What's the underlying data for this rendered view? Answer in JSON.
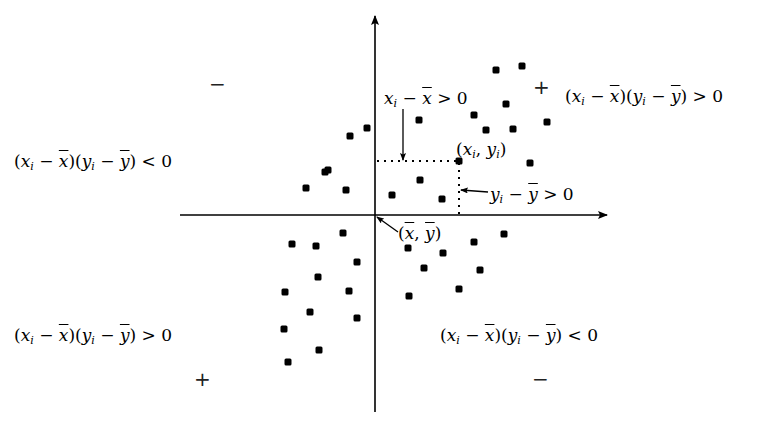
{
  "diagram": {
    "colors": {
      "background": "#ffffff",
      "ink": "#000000"
    },
    "axes": {
      "origin_label": "(x̄, ȳ)",
      "origin_px": [
        375,
        215
      ],
      "x_axis_px": {
        "from": 180,
        "to": 608,
        "y": 215
      },
      "y_axis_px": {
        "from": 412,
        "to": 15,
        "x": 375
      }
    },
    "highlighted_point": {
      "label": "(x_i, y_i)",
      "px": [
        459,
        161
      ],
      "annotations": {
        "dx": "x_i − x̄ > 0",
        "dy": "y_i − ȳ > 0"
      }
    },
    "quadrants": {
      "top_right": {
        "sign": "+",
        "condition": "(x_i − x̄)(y_i − ȳ) > 0"
      },
      "top_left": {
        "sign": "−",
        "condition": "(x_i − x̄)(y_i − ȳ) < 0"
      },
      "bottom_left": {
        "sign": "+",
        "condition": "(x_i − x̄)(y_i − ȳ) > 0"
      },
      "bottom_right": {
        "sign": "−",
        "condition": "(x_i − x̄)(y_i − ȳ) < 0"
      }
    },
    "points_px": [
      [
        367,
        128
      ],
      [
        350,
        136
      ],
      [
        328,
        170
      ],
      [
        325,
        172
      ],
      [
        306,
        188
      ],
      [
        346,
        190
      ],
      [
        419,
        120
      ],
      [
        392,
        195
      ],
      [
        420,
        180
      ],
      [
        442,
        199
      ],
      [
        474,
        115
      ],
      [
        486,
        130
      ],
      [
        496,
        70
      ],
      [
        522,
        66
      ],
      [
        506,
        104
      ],
      [
        513,
        129
      ],
      [
        547,
        122
      ],
      [
        530,
        163
      ],
      [
        459,
        161
      ],
      [
        292,
        244
      ],
      [
        316,
        246
      ],
      [
        343,
        233
      ],
      [
        357,
        262
      ],
      [
        318,
        277
      ],
      [
        285,
        292
      ],
      [
        349,
        291
      ],
      [
        310,
        312
      ],
      [
        284,
        329
      ],
      [
        357,
        318
      ],
      [
        319,
        350
      ],
      [
        288,
        362
      ],
      [
        408,
        248
      ],
      [
        443,
        253
      ],
      [
        474,
        242
      ],
      [
        504,
        234
      ],
      [
        424,
        268
      ],
      [
        480,
        270
      ],
      [
        459,
        289
      ],
      [
        409,
        296
      ]
    ]
  }
}
